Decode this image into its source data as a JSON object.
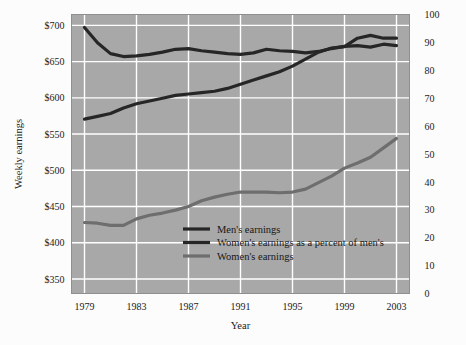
{
  "figure": {
    "background_color": "#fcfcfc",
    "plot_background_color": "#a8a8a8",
    "gridline_color": "#ffffff",
    "frame_color": "#8f8f8f"
  },
  "chart_data": {
    "type": "line",
    "title": "",
    "xlabel": "Year",
    "ylabel": "Weekly earnings",
    "y2label": "",
    "grid": true,
    "legend_position": "inside-lower-center",
    "x": [
      1979,
      1980,
      1981,
      1982,
      1983,
      1984,
      1985,
      1986,
      1987,
      1988,
      1989,
      1990,
      1991,
      1992,
      1993,
      1994,
      1995,
      1996,
      1997,
      1998,
      1999,
      2000,
      2001,
      2002,
      2003
    ],
    "xlim": [
      1978,
      2004
    ],
    "xticks": [
      1979,
      1983,
      1987,
      1991,
      1995,
      1999,
      2003
    ],
    "xticklabels": [
      "1979",
      "1983",
      "1987",
      "1991",
      "1995",
      "1999",
      "2003"
    ],
    "ylim": [
      330,
      715
    ],
    "yticks": [
      350,
      400,
      450,
      500,
      550,
      600,
      650,
      700
    ],
    "yticklabels": [
      "$350",
      "$400",
      "$450",
      "$500",
      "$550",
      "$600",
      "$650",
      "$700"
    ],
    "y2lim": [
      0,
      100
    ],
    "y2ticks": [
      0,
      10,
      20,
      30,
      40,
      50,
      60,
      70,
      80,
      90,
      100
    ],
    "y2ticklabels": [
      "0",
      "10",
      "20",
      "30",
      "40",
      "50",
      "60",
      "70",
      "80",
      "90",
      "100"
    ],
    "series": [
      {
        "name": "Men's earnings",
        "legend_label": "Men's earnings",
        "axis": "left",
        "color": "#262626",
        "width": 3.2,
        "values": [
          697,
          676,
          661,
          657,
          658,
          660,
          663,
          667,
          668,
          665,
          663,
          661,
          660,
          662,
          667,
          665,
          664,
          662,
          664,
          668,
          671,
          672,
          670,
          674,
          672
        ]
      },
      {
        "name": "Women's earnings as a percent of men's",
        "legend_label": "Women's earnings as a percent of men's",
        "axis": "right",
        "color": "#262626",
        "width": 3.2,
        "values": [
          62.5,
          63.5,
          64.5,
          66.5,
          68.0,
          69.0,
          70.0,
          71.0,
          71.5,
          72.0,
          72.5,
          73.5,
          75.0,
          76.5,
          78.0,
          79.5,
          81.5,
          84.0,
          86.5,
          88.0,
          88.5,
          91.5,
          92.5,
          91.5,
          91.5
        ]
      },
      {
        "name": "Women's earnings",
        "legend_label": "Women's earnings",
        "axis": "left",
        "color": "#6e6e6e",
        "width": 3.2,
        "values": [
          428,
          427,
          424,
          424,
          433,
          438,
          441,
          445,
          450,
          458,
          463,
          467,
          470,
          470,
          470,
          469,
          470,
          474,
          483,
          492,
          503,
          510,
          518,
          531,
          544
        ]
      }
    ]
  }
}
